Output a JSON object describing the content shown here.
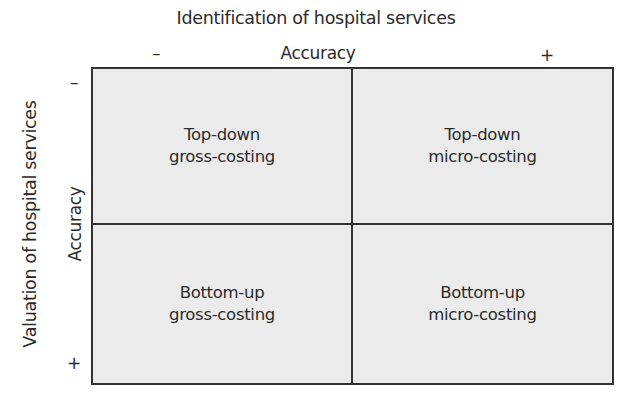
{
  "diagram": {
    "top_axis": {
      "title": "Identification of hospital services",
      "label": "Accuracy",
      "low": "–",
      "high": "+"
    },
    "left_axis": {
      "title": "Valuation of hospital services",
      "label": "Accuracy",
      "low": "–",
      "high": "+"
    },
    "quadrants": [
      {
        "position": "top-left",
        "line1": "Top-down",
        "line2": "gross-costing"
      },
      {
        "position": "top-right",
        "line1": "Top-down",
        "line2": "micro-costing"
      },
      {
        "position": "bottom-left",
        "line1": "Bottom-up",
        "line2": "gross-costing"
      },
      {
        "position": "bottom-right",
        "line1": "Bottom-up",
        "line2": "micro-costing"
      }
    ],
    "colors": {
      "fill": "#ebebeb",
      "border": "#333333",
      "text": "#2a2a2a"
    }
  }
}
